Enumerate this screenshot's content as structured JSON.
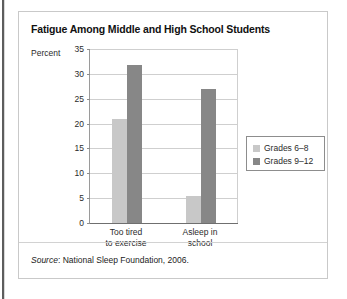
{
  "page": {
    "background": "#ffffff",
    "panel_border_color": "#c9c9c9"
  },
  "chart_data": {
    "type": "bar",
    "title": "Fatigue Among Middle and High School Students",
    "xlabel": "",
    "ylabel": "Percent",
    "categories": [
      "Too tired\nto exercise",
      "Asleep in\nschool"
    ],
    "ylim": [
      0,
      35
    ],
    "yticks": [
      0,
      5,
      10,
      15,
      20,
      25,
      30,
      35
    ],
    "ytick_labels": [
      "0",
      "5",
      "10",
      "15",
      "20",
      "25",
      "30",
      "35"
    ],
    "grid": true,
    "legend_position": "right",
    "series": [
      {
        "name": "Grades 6–8",
        "color": "#c8c8c8",
        "values": [
          21,
          5.5
        ]
      },
      {
        "name": "Grades 9–12",
        "color": "#878787",
        "values": [
          31.8,
          27
        ]
      }
    ]
  },
  "source": {
    "label": "Source",
    "text": ": National Sleep Foundation, 2006."
  }
}
